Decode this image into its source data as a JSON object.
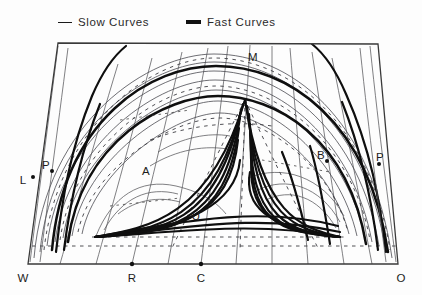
{
  "legend": {
    "slow": {
      "label": "Slow Curves",
      "icon": "thin-line-sample",
      "stroke": "#1a1a1a"
    },
    "fast": {
      "label": "Fast Curves",
      "icon": "thick-line-sample",
      "stroke": "#111111"
    }
  },
  "figure": {
    "type": "phase-plane-diagram",
    "background": "#fdfdfd",
    "frame": {
      "shape": "trapezoid",
      "corners": {
        "top_left": [
          58,
          43
        ],
        "top_right": [
          378,
          44
        ],
        "bottom_right": [
          398,
          264
        ],
        "bottom_left": [
          28,
          264
        ]
      },
      "stroke": "#3a3a3a"
    },
    "nodes": [
      {
        "name": "left-fan-node",
        "x": 95,
        "y": 237
      },
      {
        "name": "right-fan-node",
        "x": 340,
        "y": 237
      },
      {
        "name": "top-fan-node",
        "x": 245,
        "y": 100
      }
    ],
    "labels": [
      {
        "id": "M",
        "text": "M",
        "x": 253,
        "y": 57
      },
      {
        "id": "L",
        "text": "L",
        "x": 23,
        "y": 180
      },
      {
        "id": "P_left",
        "text": "P",
        "x": 46,
        "y": 165
      },
      {
        "id": "A",
        "text": "A",
        "x": 146,
        "y": 171
      },
      {
        "id": "U",
        "text": "U",
        "x": 196,
        "y": 216
      },
      {
        "id": "B",
        "text": "B",
        "x": 321,
        "y": 155
      },
      {
        "id": "P_right",
        "text": "P",
        "x": 380,
        "y": 157
      },
      {
        "id": "W",
        "text": "W",
        "x": 23,
        "y": 278
      },
      {
        "id": "R",
        "text": "R",
        "x": 132,
        "y": 278
      },
      {
        "id": "C",
        "text": "C",
        "x": 201,
        "y": 278
      },
      {
        "id": "O",
        "text": "O",
        "x": 401,
        "y": 278
      }
    ],
    "axis_points": [
      {
        "id": "R",
        "x": 132,
        "y": 264
      },
      {
        "id": "C",
        "x": 201,
        "y": 264
      },
      {
        "id": "L",
        "x": 33,
        "y": 177
      },
      {
        "id": "P_left",
        "x": 52,
        "y": 171
      },
      {
        "id": "B",
        "x": 327,
        "y": 161
      },
      {
        "id": "P_right",
        "x": 379,
        "y": 164
      }
    ]
  }
}
